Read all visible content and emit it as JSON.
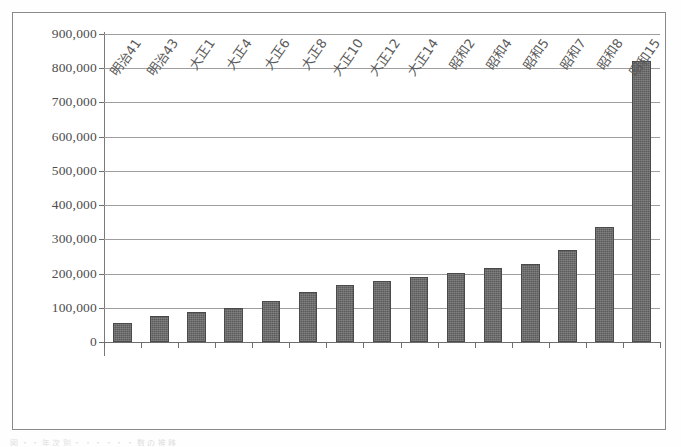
{
  "chart_data": {
    "type": "bar",
    "title": "",
    "subtitle": "",
    "xlabel": "",
    "ylabel": "",
    "grid": true,
    "legend": "none",
    "ylim": [
      0,
      900000
    ],
    "ytick_step": 100000,
    "ytick_labels": [
      "900,000",
      "800,000",
      "700,000",
      "600,000",
      "500,000",
      "400,000",
      "300,000",
      "200,000",
      "100,000",
      "0"
    ],
    "ytick_values": [
      900000,
      800000,
      700000,
      600000,
      500000,
      400000,
      300000,
      200000,
      100000,
      0
    ],
    "categories": [
      "明治41",
      "明治43",
      "大正1",
      "大正4",
      "大正6",
      "大正8",
      "大正10",
      "大正12",
      "大正14",
      "昭和2",
      "昭和4",
      "昭和5",
      "昭和7",
      "昭和8",
      "昭和15"
    ],
    "values": [
      55000,
      76000,
      88000,
      100000,
      120000,
      146000,
      167000,
      178000,
      190000,
      202000,
      216000,
      229000,
      270000,
      335000,
      820000
    ],
    "bar_color": "#5b5b5b",
    "grid_color": "#9e9e9e",
    "axis_color": "#6e6e6e",
    "frame_color": "#8a8a8a",
    "background": "#ffffff"
  },
  "footer": {
    "smudge_text": "図 ・ ・ 年 次 別 ・ ・ ・ ・ ・ ・ 数 の 推 移"
  }
}
